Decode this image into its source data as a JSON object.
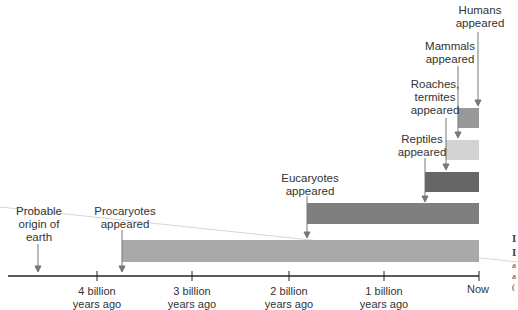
{
  "axis": {
    "ticks": [
      {
        "label_line1": "4 billion",
        "label_line2": "years ago",
        "x": 97
      },
      {
        "label_line1": "3 billion",
        "label_line2": "years ago",
        "x": 192
      },
      {
        "label_line1": "2 billion",
        "label_line2": "years ago",
        "x": 289
      },
      {
        "label_line1": "1 billion",
        "label_line2": "years ago",
        "x": 384
      },
      {
        "label_line1": "Now",
        "label_line2": "",
        "x": 478
      }
    ]
  },
  "events": [
    {
      "line1": "Probable",
      "line2": "origin of",
      "line3": "earth"
    },
    {
      "line1": "Procaryotes",
      "line2": "appeared"
    },
    {
      "line1": "Eucaryotes",
      "line2": "appeared"
    },
    {
      "line1": "Reptiles",
      "line2": "appeared"
    },
    {
      "line1": "Roaches,",
      "line2": "termites",
      "line3": "appeared"
    },
    {
      "line1": "Mammals",
      "line2": "appeared"
    },
    {
      "line1": "Humans",
      "line2": "appeared"
    }
  ],
  "bars": [
    {
      "name": "procaryotes",
      "color": "#a9a9a9"
    },
    {
      "name": "eucaryotes",
      "color": "#7f7f7f"
    },
    {
      "name": "reptiles",
      "color": "#666666"
    },
    {
      "name": "roaches-termites",
      "color": "#d3d3d3"
    },
    {
      "name": "mammals",
      "color": "#999999"
    }
  ],
  "margin_fragments": {
    "a": "I",
    "b": "I",
    "c": "a",
    "d": "a",
    "e": "("
  }
}
